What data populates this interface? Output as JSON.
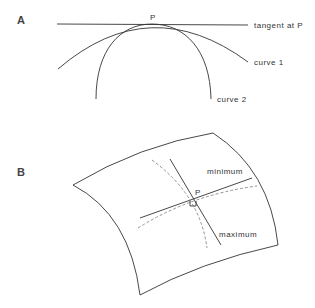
{
  "panel_a": {
    "label": "A",
    "point_label": "P",
    "tangent_label": "tangent at P",
    "curve1_label": "curve 1",
    "curve2_label": "curve 2"
  },
  "panel_b": {
    "label": "B",
    "point_label": "P",
    "minimum_label": "minimum",
    "maximum_label": "maximum"
  }
}
